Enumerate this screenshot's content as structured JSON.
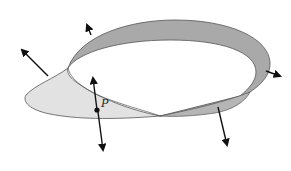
{
  "figure": {
    "point_label": "P",
    "colors": {
      "background": "#ffffff",
      "dark_surface": "#a9a9a9",
      "light_surface": "#e2e2e2",
      "edge": "#555555",
      "arrow": "#111111"
    }
  }
}
